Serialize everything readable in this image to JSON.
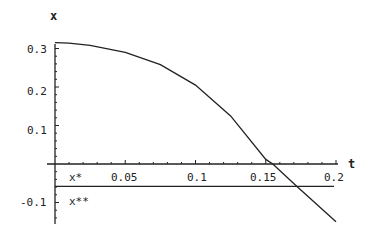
{
  "chart_data": {
    "type": "line",
    "title": "",
    "xlabel": "t",
    "ylabel": "x",
    "xlim": [
      0,
      0.2
    ],
    "ylim": [
      -0.15,
      0.32
    ],
    "grid": false,
    "x_ticks": [
      "0.05",
      "0.1",
      "0.15",
      "0.2"
    ],
    "y_ticks": [
      "0.3",
      "0.2",
      "0.1",
      "-0.1"
    ],
    "series": [
      {
        "name": "x(t)",
        "x": [
          0,
          0.01,
          0.025,
          0.05,
          0.075,
          0.1,
          0.125,
          0.15,
          0.155,
          0.172,
          0.2
        ],
        "y": [
          0.315,
          0.314,
          0.308,
          0.29,
          0.258,
          0.205,
          0.125,
          0.012,
          0.0,
          -0.058,
          -0.15
        ]
      }
    ],
    "reference_lines": [
      {
        "name": "x*",
        "y": 0.0,
        "label": "x*"
      },
      {
        "name": "x**",
        "y": -0.058,
        "label": "x**"
      }
    ],
    "annotations": [
      "x*",
      "x**"
    ]
  },
  "labels": {
    "y_axis_title": "x",
    "x_axis_title": "t",
    "x_star": "x*",
    "x_star_star": "x**",
    "xt": [
      "0.05",
      "0.1",
      "0.15",
      "0.2"
    ],
    "yt": [
      "0.3",
      "0.2",
      "0.1",
      "-0.1"
    ]
  }
}
